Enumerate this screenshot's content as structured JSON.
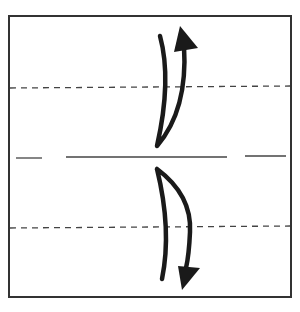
{
  "diagram": {
    "type": "origami-fold-diagram",
    "frame": {
      "x": 8,
      "y": 16,
      "width": 284,
      "height": 282,
      "stroke": "#333333"
    },
    "valley_folds": [
      {
        "y": 88,
        "style": "dashed"
      },
      {
        "y": 228,
        "style": "dashed"
      }
    ],
    "center_crease": {
      "y": 157,
      "segments": [
        [
          16,
          42
        ],
        [
          66,
          227
        ],
        [
          245,
          286
        ]
      ]
    },
    "arrows": [
      {
        "id": "top-fold-arrow",
        "direction": "up",
        "meaning": "fold top edge down to center and unfold"
      },
      {
        "id": "bottom-fold-arrow",
        "direction": "down",
        "meaning": "fold bottom edge up to center and unfold"
      }
    ],
    "colors": {
      "line": "#333333",
      "arrow": "#1a1a1a",
      "background": "#ffffff"
    }
  }
}
